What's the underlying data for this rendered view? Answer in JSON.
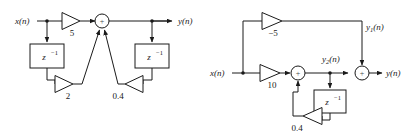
{
  "figure": {
    "title": "",
    "background_color": "#ffffff",
    "line_color": "#1a1a1a",
    "diagram_count": 2
  },
  "diagram_left": {
    "name": "left-block-diagram",
    "input_label": "x(n)",
    "output_label": "y(n)",
    "gains": [
      {
        "id": "gain-5",
        "value": "5",
        "direction": "right"
      },
      {
        "id": "gain-2",
        "value": "2",
        "direction": "right"
      },
      {
        "id": "gain-04",
        "value": "0.4",
        "direction": "left"
      }
    ],
    "delays": [
      {
        "id": "delay-left",
        "label_base": "z",
        "label_exp": "−1"
      },
      {
        "id": "delay-right",
        "label_base": "z",
        "label_exp": "−1"
      }
    ],
    "summers": [
      {
        "id": "summer-main",
        "sign": "+",
        "input_count": 3
      }
    ]
  },
  "diagram_right": {
    "name": "right-block-diagram",
    "input_label": "x(n)",
    "output_label": "y(n)",
    "intermediate_labels": [
      {
        "id": "y1",
        "base": "y",
        "sub": "1",
        "tail": "(n)"
      },
      {
        "id": "y2",
        "base": "y",
        "sub": "2",
        "tail": "(n)"
      }
    ],
    "gains": [
      {
        "id": "gain-minus5",
        "value": "−5",
        "direction": "right"
      },
      {
        "id": "gain-10",
        "value": "10",
        "direction": "right"
      },
      {
        "id": "gain-04",
        "value": "0.4",
        "direction": "left"
      }
    ],
    "delays": [
      {
        "id": "delay-feedback",
        "label_base": "z",
        "label_exp": "−1"
      }
    ],
    "summers": [
      {
        "id": "summer-first",
        "sign": "+",
        "input_count": 2
      },
      {
        "id": "summer-second",
        "sign": "+",
        "input_count": 2
      }
    ]
  }
}
